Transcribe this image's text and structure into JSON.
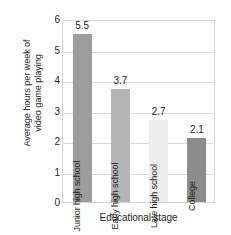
{
  "chart_data": {
    "type": "bar",
    "title": "",
    "xlabel": "Educational stage",
    "ylabel": "Average hours per week of video game playing",
    "ylabel_lines": [
      "Average hours per week of",
      "video game playing"
    ],
    "categories": [
      "Junior high school",
      "Early high school",
      "Late high school",
      "College"
    ],
    "values": [
      5.5,
      3.7,
      2.7,
      2.1
    ],
    "value_labels": [
      "5.5",
      "3.7",
      "2.7",
      "2.1"
    ],
    "ylim": [
      0,
      6
    ],
    "yticks": [
      0,
      1,
      2,
      3,
      4,
      5,
      6
    ],
    "ytick_labels": [
      "0",
      "1",
      "2",
      "3",
      "4",
      "5",
      "6"
    ],
    "grid": true,
    "grid_axis": "y",
    "legend": null,
    "bar_colors": [
      "#9d9d9d",
      "#b5b5b5",
      "#ededed",
      "#8c8c8c"
    ],
    "bar_label_colors": [
      "#231f20",
      "#231f20",
      "#231f20",
      "#231f20"
    ],
    "plot_border_color": "#d5d5d5",
    "gridline_color": "#d9d9d9",
    "text_color": "#231f20"
  }
}
